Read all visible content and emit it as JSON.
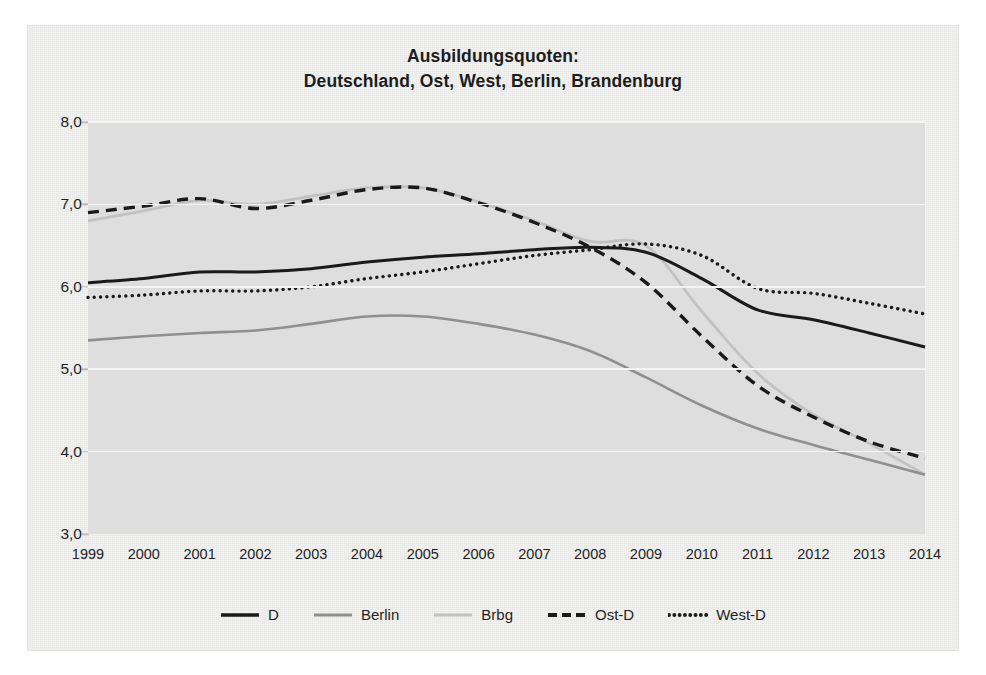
{
  "chart_data": {
    "type": "line",
    "title": "Ausbildungsquoten:",
    "subtitle": "Deutschland, Ost, West, Berlin, Brandenburg",
    "xlabel": "",
    "ylabel": "",
    "x": [
      1999,
      2000,
      2001,
      2002,
      2003,
      2004,
      2005,
      2006,
      2007,
      2008,
      2009,
      2010,
      2011,
      2012,
      2013,
      2014
    ],
    "xtick_labels": [
      "1999",
      "2000",
      "2001",
      "2002",
      "2003",
      "2004",
      "2005",
      "2006",
      "2007",
      "2008",
      "2009",
      "2010",
      "2011",
      "2012",
      "2013",
      "2014"
    ],
    "ytick_labels": [
      "8,0",
      "7,0",
      "6,0",
      "5,0",
      "4,0",
      "3,0"
    ],
    "yticks": [
      8.0,
      7.0,
      6.0,
      5.0,
      4.0,
      3.0
    ],
    "ylim": [
      3.0,
      8.0
    ],
    "xlim": [
      1999,
      2014
    ],
    "grid": "horizontal",
    "legend_position": "bottom",
    "series": [
      {
        "name": "D",
        "style": "solid",
        "color": "#1a1a1a",
        "width": 3.0,
        "values": [
          6.05,
          6.1,
          6.18,
          6.18,
          6.22,
          6.3,
          6.36,
          6.4,
          6.45,
          6.48,
          6.42,
          6.1,
          5.72,
          5.6,
          5.44,
          5.27
        ]
      },
      {
        "name": "Berlin",
        "style": "solid",
        "color": "#8f8f8f",
        "width": 2.6,
        "values": [
          5.35,
          5.4,
          5.44,
          5.47,
          5.55,
          5.64,
          5.64,
          5.55,
          5.42,
          5.22,
          4.9,
          4.56,
          4.28,
          4.08,
          3.9,
          3.72
        ]
      },
      {
        "name": "Brbg",
        "style": "solid",
        "color": "#c2c2c2",
        "width": 2.8,
        "values": [
          6.8,
          6.92,
          7.05,
          7.0,
          7.1,
          7.2,
          7.2,
          7.03,
          6.8,
          6.55,
          6.5,
          5.7,
          4.95,
          4.45,
          4.1,
          3.72
        ]
      },
      {
        "name": "Ost-D",
        "style": "dashed",
        "color": "#1a1a1a",
        "width": 3.4,
        "values": [
          6.9,
          6.98,
          7.07,
          6.95,
          7.05,
          7.18,
          7.2,
          7.02,
          6.78,
          6.48,
          6.05,
          5.4,
          4.8,
          4.42,
          4.12,
          3.92
        ]
      },
      {
        "name": "West-D",
        "style": "dotted",
        "color": "#1a1a1a",
        "width": 3.4,
        "values": [
          5.87,
          5.9,
          5.95,
          5.95,
          6.0,
          6.1,
          6.18,
          6.28,
          6.38,
          6.45,
          6.52,
          6.38,
          5.98,
          5.92,
          5.8,
          5.67
        ]
      }
    ]
  },
  "legend": {
    "items": [
      {
        "label": "D",
        "swatch": "solid-black-line-icon"
      },
      {
        "label": "Berlin",
        "swatch": "solid-gray-line-icon"
      },
      {
        "label": "Brbg",
        "swatch": "solid-lightgray-line-icon"
      },
      {
        "label": "Ost-D",
        "swatch": "dashed-black-line-icon"
      },
      {
        "label": "West-D",
        "swatch": "dotted-black-line-icon"
      }
    ]
  },
  "colors": {
    "plot_background": "#dedede",
    "page_background": "#f2f2f0",
    "gridline": "#f4f4f4",
    "text": "#1f1f1f"
  }
}
